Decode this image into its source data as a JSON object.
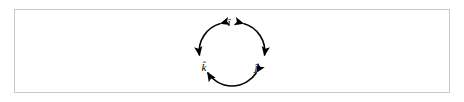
{
  "figure": {
    "kind": "cyclic-unit-vector-diagram",
    "frame_color": "#c9c9c9",
    "background_color": "#ffffff",
    "stroke_color": "#000000"
  },
  "diagram": {
    "nodes": [
      {
        "id": "i",
        "label": "î",
        "position": "top"
      },
      {
        "id": "j",
        "label": "ĵ",
        "position": "bottom-right"
      },
      {
        "id": "k",
        "label": "k̂",
        "position": "bottom-left"
      }
    ],
    "arcs": [
      {
        "id": "arc-i-j",
        "from": "i",
        "to": "j",
        "double_headed": true,
        "side": "right"
      },
      {
        "id": "arc-j-k",
        "from": "j",
        "to": "k",
        "double_headed": true,
        "side": "bottom"
      },
      {
        "id": "arc-k-i",
        "from": "k",
        "to": "i",
        "double_headed": true,
        "side": "left"
      }
    ]
  }
}
